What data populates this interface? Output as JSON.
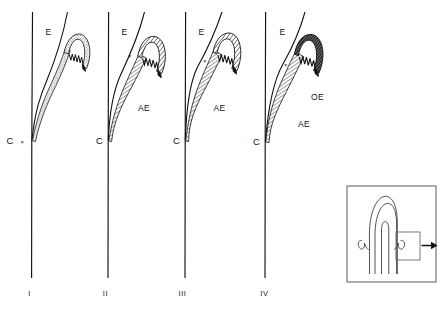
{
  "figure": {
    "background_color": "#ffffff",
    "ink_color": "#111111",
    "panel_count": 4
  },
  "panels": [
    {
      "id": "panel-1",
      "number_label": "I",
      "labels": {
        "epithelium": "E",
        "cementum": "C",
        "attachment_epithelium": "",
        "oral_epithelium": "",
        "marker": "×"
      },
      "hook_fill": "stipple",
      "hook_fill_color": "#9a9a9a",
      "has_AE": false,
      "has_OE": false,
      "marker_at_base": true
    },
    {
      "id": "panel-2",
      "number_label": "II",
      "labels": {
        "epithelium": "E",
        "cementum": "C",
        "attachment_epithelium": "AE",
        "oral_epithelium": "",
        "marker": "×"
      },
      "hook_fill": "hatch",
      "hook_fill_color": "#3a3a3a",
      "has_AE": true,
      "has_OE": false,
      "marker_at_base": false
    },
    {
      "id": "panel-3",
      "number_label": "III",
      "labels": {
        "epithelium": "E",
        "cementum": "C",
        "attachment_epithelium": "AE",
        "oral_epithelium": "",
        "marker": "×"
      },
      "hook_fill": "hatch",
      "hook_fill_color": "#3a3a3a",
      "has_AE": true,
      "has_OE": false,
      "marker_at_base": false
    },
    {
      "id": "panel-4",
      "number_label": "IV",
      "labels": {
        "epithelium": "E",
        "cementum": "C",
        "attachment_epithelium": "AE",
        "oral_epithelium": "OE",
        "marker": "×"
      },
      "hook_fill": "dense",
      "hook_fill_color": "#1a1a1a",
      "has_AE": true,
      "has_OE": true,
      "marker_at_base": false
    }
  ],
  "inset": {
    "id": "inset-box",
    "description": "tooth crown cross-section with boxed detail region and arrow",
    "border_color": "#555555",
    "arrow": "→"
  }
}
